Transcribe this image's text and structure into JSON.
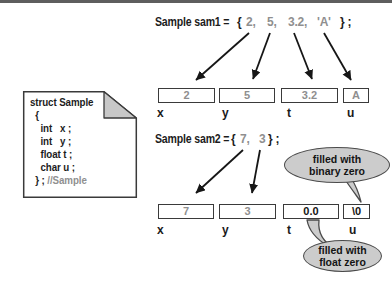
{
  "colors": {
    "ink": "#1c1c1c",
    "muted_text": "#8f8f8f",
    "box_border": "#3a3a3a",
    "bubble_fill": "#cccccc",
    "fold_fill": "#c8c8c8",
    "top_rule": "#5e5e5e"
  },
  "declarations": {
    "sam1": {
      "full_text": "Sample sam1 = { 2, 5, 3.2, 'A' } ;",
      "tokens": [
        "Sample sam1 =",
        "{",
        "2,",
        "5,",
        "3.2,",
        "'A'",
        "} ;"
      ]
    },
    "sam2": {
      "full_text": "Sample sam2 = { 7, 3 } ;",
      "tokens": [
        "Sample sam2 =",
        "{",
        "7,",
        "3",
        "} ;"
      ]
    }
  },
  "struct_card": {
    "code": "struct Sample\n  {\n    int   x ;\n    int   y ;\n    float t ;\n    char u ;\n  } ; ",
    "comment": "//Sample"
  },
  "rows": {
    "sam1": {
      "cells": [
        {
          "field": "x",
          "value": "2"
        },
        {
          "field": "y",
          "value": "5"
        },
        {
          "field": "t",
          "value": "3.2"
        },
        {
          "field": "u",
          "value": "A"
        }
      ]
    },
    "sam2": {
      "cells": [
        {
          "field": "x",
          "value": "7"
        },
        {
          "field": "y",
          "value": "3"
        },
        {
          "field": "t",
          "value": "0.0"
        },
        {
          "field": "u",
          "value": "\\0"
        }
      ]
    }
  },
  "callouts": {
    "binary_zero": {
      "line1": "filled with",
      "line2": "binary zero"
    },
    "float_zero": {
      "line1": "filled with",
      "line2": "float zero"
    }
  }
}
